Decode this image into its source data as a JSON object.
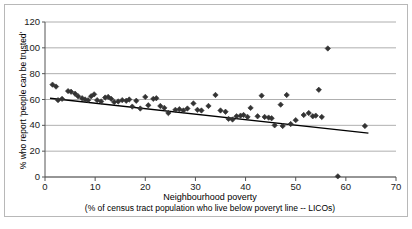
{
  "chart_data": {
    "type": "scatter",
    "title": "",
    "xlabel": "Neighbourhood poverty",
    "xsublabel": "(% of  census tract population who live below poveryt line -- LICOs)",
    "ylabel": "% who report 'people can be trusted'",
    "xlim": [
      0,
      70
    ],
    "ylim": [
      0,
      120
    ],
    "xticks": [
      0,
      10,
      20,
      30,
      40,
      50,
      60,
      70
    ],
    "yticks": [
      0,
      20,
      40,
      60,
      80,
      100,
      120
    ],
    "grid": "horizontal",
    "legend": "none",
    "marker": "diamond",
    "marker_color": "#333333",
    "trendline": {
      "label": "linear trend",
      "color": "#000000",
      "x_start": 1.0,
      "y_start": 61.0,
      "x_end": 64.5,
      "y_end": 34.0
    },
    "points": [
      {
        "x": 1.5,
        "y": 71.5
      },
      {
        "x": 2.2,
        "y": 70.0
      },
      {
        "x": 2.6,
        "y": 59.5
      },
      {
        "x": 3.4,
        "y": 60.5
      },
      {
        "x": 4.6,
        "y": 66.5
      },
      {
        "x": 5.2,
        "y": 66.0
      },
      {
        "x": 6.0,
        "y": 64.5
      },
      {
        "x": 6.6,
        "y": 62.5
      },
      {
        "x": 7.4,
        "y": 61.0
      },
      {
        "x": 8.0,
        "y": 60.0
      },
      {
        "x": 8.6,
        "y": 59.5
      },
      {
        "x": 9.2,
        "y": 62.5
      },
      {
        "x": 9.8,
        "y": 64.0
      },
      {
        "x": 10.4,
        "y": 59.5
      },
      {
        "x": 11.2,
        "y": 58.5
      },
      {
        "x": 12.0,
        "y": 61.5
      },
      {
        "x": 12.6,
        "y": 62.0
      },
      {
        "x": 13.2,
        "y": 60.5
      },
      {
        "x": 13.8,
        "y": 58.0
      },
      {
        "x": 14.6,
        "y": 58.5
      },
      {
        "x": 15.4,
        "y": 59.5
      },
      {
        "x": 16.2,
        "y": 59.0
      },
      {
        "x": 16.8,
        "y": 60.0
      },
      {
        "x": 17.4,
        "y": 54.5
      },
      {
        "x": 18.2,
        "y": 59.0
      },
      {
        "x": 19.0,
        "y": 53.0
      },
      {
        "x": 20.0,
        "y": 62.0
      },
      {
        "x": 20.6,
        "y": 55.5
      },
      {
        "x": 21.6,
        "y": 60.5
      },
      {
        "x": 22.2,
        "y": 61.0
      },
      {
        "x": 23.0,
        "y": 55.0
      },
      {
        "x": 23.8,
        "y": 53.5
      },
      {
        "x": 24.6,
        "y": 49.5
      },
      {
        "x": 26.0,
        "y": 52.0
      },
      {
        "x": 26.8,
        "y": 52.5
      },
      {
        "x": 27.6,
        "y": 51.5
      },
      {
        "x": 28.4,
        "y": 53.0
      },
      {
        "x": 29.6,
        "y": 57.0
      },
      {
        "x": 30.4,
        "y": 52.0
      },
      {
        "x": 31.2,
        "y": 51.5
      },
      {
        "x": 32.6,
        "y": 55.0
      },
      {
        "x": 34.0,
        "y": 63.5
      },
      {
        "x": 35.0,
        "y": 51.5
      },
      {
        "x": 36.0,
        "y": 50.5
      },
      {
        "x": 36.6,
        "y": 45.0
      },
      {
        "x": 37.4,
        "y": 44.5
      },
      {
        "x": 38.2,
        "y": 47.0
      },
      {
        "x": 39.0,
        "y": 47.5
      },
      {
        "x": 39.6,
        "y": 48.0
      },
      {
        "x": 40.4,
        "y": 46.5
      },
      {
        "x": 41.0,
        "y": 53.5
      },
      {
        "x": 42.4,
        "y": 47.0
      },
      {
        "x": 43.2,
        "y": 63.0
      },
      {
        "x": 43.8,
        "y": 46.5
      },
      {
        "x": 44.6,
        "y": 46.0
      },
      {
        "x": 45.2,
        "y": 45.5
      },
      {
        "x": 45.8,
        "y": 40.0
      },
      {
        "x": 47.0,
        "y": 56.0
      },
      {
        "x": 47.4,
        "y": 39.5
      },
      {
        "x": 48.2,
        "y": 63.5
      },
      {
        "x": 49.0,
        "y": 41.0
      },
      {
        "x": 50.0,
        "y": 44.0
      },
      {
        "x": 51.6,
        "y": 48.0
      },
      {
        "x": 52.6,
        "y": 49.5
      },
      {
        "x": 53.4,
        "y": 47.0
      },
      {
        "x": 54.0,
        "y": 47.5
      },
      {
        "x": 54.6,
        "y": 67.5
      },
      {
        "x": 55.2,
        "y": 46.5
      },
      {
        "x": 56.4,
        "y": 99.5
      },
      {
        "x": 58.4,
        "y": 0.5
      },
      {
        "x": 63.8,
        "y": 39.5
      }
    ]
  },
  "axis": {
    "y_tick_labels": [
      "120",
      "100",
      "80",
      "60",
      "40",
      "20",
      "0"
    ],
    "x_tick_labels": [
      "0",
      "10",
      "20",
      "30",
      "40",
      "50",
      "60",
      "70"
    ]
  }
}
